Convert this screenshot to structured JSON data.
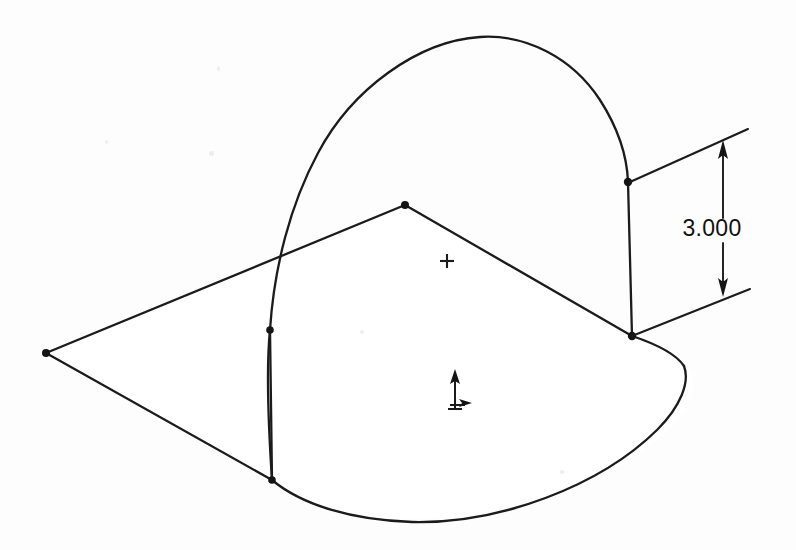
{
  "drawing": {
    "title": "Isometric sketch view",
    "background_color": "#fdfdfd",
    "line_color": "#1b1b1b",
    "units_note": "",
    "dimensions": [
      {
        "id": "height-dimension",
        "label": "3.000",
        "value": 3.0,
        "orientation": "vertical",
        "text_x": 712,
        "text_y": 236,
        "dim_line_x": 723,
        "dim_line_top_y": 142,
        "dim_line_bottom_y": 295,
        "arrow_top": "up-arrow-icon",
        "arrow_bottom": "down-arrow-icon"
      }
    ],
    "extension_lines": [
      {
        "id": "upper-extension-line",
        "x1": 630,
        "y1": 182,
        "x2": 748,
        "y2": 129
      },
      {
        "id": "lower-extension-line",
        "x1": 632,
        "y1": 336,
        "x2": 750,
        "y2": 289
      }
    ],
    "edges": {
      "apex_point": {
        "x": 405,
        "y": 205
      },
      "left_vertex": {
        "x": 46,
        "y": 353
      },
      "left_vertical_top": {
        "x": 270,
        "y": 330
      },
      "left_vertical_bottom": {
        "x": 272,
        "y": 480
      },
      "right_vertical_top": {
        "x": 628,
        "y": 182
      },
      "right_vertical_bottom": {
        "x": 632,
        "y": 336
      },
      "arch_apex": {
        "x": 505,
        "y": 38
      },
      "ellipse_bottom": {
        "x": 432,
        "y": 522
      },
      "ellipse_right": {
        "x": 688,
        "y": 404
      }
    },
    "sketch_points": [
      {
        "id": "point-left-vertex",
        "x": 46,
        "y": 353
      },
      {
        "id": "point-apex",
        "x": 405,
        "y": 205
      },
      {
        "id": "point-left-upper",
        "x": 270,
        "y": 330
      },
      {
        "id": "point-left-lower",
        "x": 272,
        "y": 480
      },
      {
        "id": "point-right-upper",
        "x": 628,
        "y": 182
      },
      {
        "id": "point-right-lower",
        "x": 632,
        "y": 336
      }
    ],
    "center_marker": {
      "id": "center-cross-icon",
      "x": 447,
      "y": 261,
      "size": 7
    },
    "origin_marker": {
      "id": "origin-triad-icon",
      "x": 455,
      "y": 408,
      "y_axis_tip": 371,
      "x_axis_tip": 418
    }
  }
}
